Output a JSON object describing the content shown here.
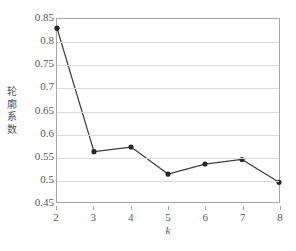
{
  "chart_data": {
    "type": "line",
    "title": "",
    "xlabel": "k",
    "ylabel": "轮廓系数",
    "x": [
      2,
      3,
      4,
      5,
      6,
      7,
      8
    ],
    "values": [
      0.83,
      0.56,
      0.57,
      0.511,
      0.533,
      0.543,
      0.493
    ],
    "series": [
      {
        "name": "轮廓系数",
        "values": [
          0.83,
          0.56,
          0.57,
          0.511,
          0.533,
          0.543,
          0.493
        ]
      }
    ],
    "xlim": [
      2,
      8
    ],
    "ylim": [
      0.45,
      0.85
    ],
    "ytick_labels": [
      "0.85",
      "0.8",
      "0.75",
      "0.7",
      "0.65",
      "0.6",
      "0.55",
      "0.5",
      "0.45"
    ],
    "ytick_values": [
      0.85,
      0.8,
      0.75,
      0.7,
      0.65,
      0.6,
      0.55,
      0.5,
      0.45
    ],
    "xtick_labels": [
      "2",
      "3",
      "4",
      "5",
      "6",
      "7",
      "8"
    ],
    "grid": "horizontal",
    "legend": "none",
    "marker": "circle",
    "colors": {
      "line": "#404040",
      "marker": "#262626",
      "gridline": "#d9d9d9",
      "border": "#a6a6a6",
      "text": "#595959"
    }
  }
}
